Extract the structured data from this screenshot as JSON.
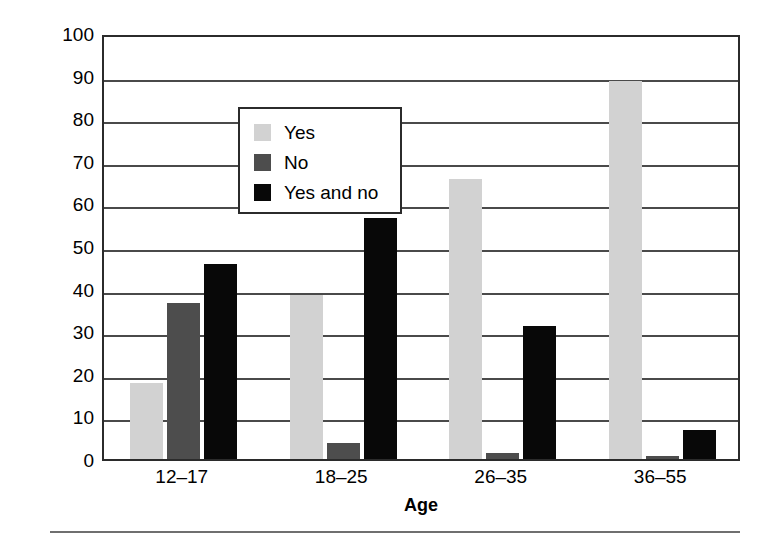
{
  "figure": {
    "background_color": "#ffffff",
    "frame_color": "#2b2b2b",
    "grid_color": "#4a4a4a",
    "rule_color": "#6f6f6f"
  },
  "chart_data": {
    "type": "bar",
    "title": "",
    "subtitle": "",
    "xlabel": "Age",
    "ylabel": "Percentage",
    "categories": [
      "12–17",
      "18–25",
      "26–35",
      "36–55"
    ],
    "series": [
      {
        "name": "Yes",
        "color": "#d2d2d2",
        "values": [
          17.8,
          38.5,
          65.8,
          88.8
        ]
      },
      {
        "name": "No",
        "color": "#4d4d4d",
        "values": [
          36.6,
          3.8,
          1.5,
          0.8
        ]
      },
      {
        "name": "Yes and no",
        "color": "#080808",
        "values": [
          45.7,
          56.6,
          31.2,
          6.9
        ]
      }
    ],
    "ylim": [
      0,
      100
    ],
    "yticks": [
      0,
      10,
      20,
      30,
      40,
      50,
      60,
      70,
      80,
      90,
      100
    ],
    "ytick_labels": [
      "0",
      "10",
      "20",
      "30",
      "40",
      "50",
      "60",
      "70",
      "80",
      "90",
      "100"
    ],
    "grid": "horizontal",
    "legend_position": "upper-left-inside",
    "legend_entries": [
      "Yes",
      "No",
      "Yes and no"
    ],
    "annotations": []
  }
}
